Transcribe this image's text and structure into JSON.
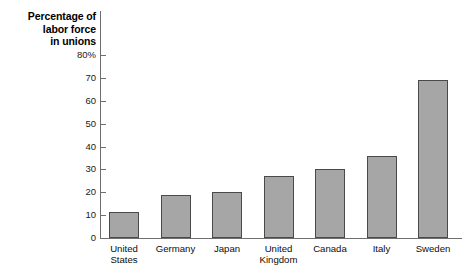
{
  "chart_data": {
    "type": "bar",
    "title": "Percentage of labor force in unions",
    "title_lines": "Percentage of\nlabor force\nin unions",
    "xlabel": "",
    "ylabel": "Percentage of labor force in unions",
    "ylim": [
      0,
      80
    ],
    "grid": false,
    "legend": "none",
    "y_ticks": [
      "80%",
      "70",
      "60",
      "50",
      "40",
      "30",
      "20",
      "10",
      "0"
    ],
    "y_tick_values": [
      80,
      70,
      60,
      50,
      40,
      30,
      20,
      10,
      0
    ],
    "categories": [
      "United\nStates",
      "Germany",
      "Japan",
      "United\nKingdom",
      "Canada",
      "Italy",
      "Sweden"
    ],
    "category_names": [
      "United States",
      "Germany",
      "Japan",
      "United Kingdom",
      "Canada",
      "Italy",
      "Sweden"
    ],
    "values": [
      11.5,
      19,
      20,
      27,
      30,
      36,
      69
    ],
    "bar_fill_color": "#a6a6a6",
    "bar_border_color": "#4a4a4a",
    "axis_color": "#6f6f6f",
    "background_color": "#ffffff"
  }
}
